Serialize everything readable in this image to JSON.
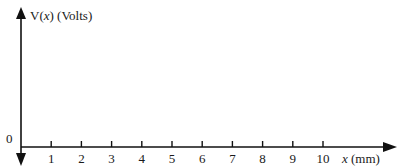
{
  "chart_data": {
    "type": "line",
    "title": "",
    "xlabel": "x (mm)",
    "xlabel_var": "x",
    "xlabel_unit": " (mm)",
    "ylabel": "V(x) (Volts)",
    "ylabel_prefix": "V(",
    "ylabel_var": "x",
    "ylabel_suffix": ") (Volts)",
    "x_ticks": [
      "1",
      "2",
      "3",
      "4",
      "5",
      "6",
      "7",
      "8",
      "9",
      "10"
    ],
    "x_tick_values": [
      1,
      2,
      3,
      4,
      5,
      6,
      7,
      8,
      9,
      10
    ],
    "y_origin_label": "0",
    "xlim": [
      0,
      11.5
    ],
    "series": [],
    "grid": false,
    "legend": "none",
    "axis_color": "#111111"
  }
}
